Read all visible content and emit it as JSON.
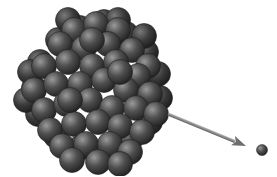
{
  "diagram": {
    "background": "#ffffff",
    "nucleus": {
      "sphere_radius": 12.5,
      "base_color": "#3c3c3c",
      "highlight_color": "#8a8a8a",
      "edge_color": "#1e1e1e",
      "back_spheres": [
        [
          80,
          28
        ],
        [
          104,
          22
        ],
        [
          58,
          40
        ],
        [
          126,
          34
        ],
        [
          146,
          52
        ],
        [
          40,
          62
        ],
        [
          34,
          88
        ],
        [
          38,
          114
        ],
        [
          56,
          136
        ],
        [
          80,
          148
        ],
        [
          106,
          150
        ],
        [
          130,
          140
        ],
        [
          150,
          122
        ],
        [
          160,
          98
        ],
        [
          158,
          74
        ],
        [
          68,
          20
        ],
        [
          118,
          20
        ],
        [
          144,
          36
        ],
        [
          26,
          100
        ],
        [
          30,
          72
        ]
      ],
      "front_spheres": [
        [
          74,
          30
        ],
        [
          96,
          24
        ],
        [
          118,
          30
        ],
        [
          60,
          44
        ],
        [
          84,
          48
        ],
        [
          108,
          44
        ],
        [
          132,
          50
        ],
        [
          148,
          66
        ],
        [
          44,
          66
        ],
        [
          68,
          62
        ],
        [
          92,
          66
        ],
        [
          116,
          62
        ],
        [
          138,
          76
        ],
        [
          34,
          90
        ],
        [
          56,
          84
        ],
        [
          80,
          84
        ],
        [
          104,
          80
        ],
        [
          126,
          90
        ],
        [
          150,
          94
        ],
        [
          44,
          110
        ],
        [
          66,
          104
        ],
        [
          90,
          100
        ],
        [
          112,
          108
        ],
        [
          136,
          108
        ],
        [
          156,
          114
        ],
        [
          50,
          130
        ],
        [
          74,
          124
        ],
        [
          98,
          122
        ],
        [
          120,
          126
        ],
        [
          142,
          132
        ],
        [
          62,
          146
        ],
        [
          86,
          144
        ],
        [
          110,
          144
        ],
        [
          130,
          152
        ],
        [
          72,
          160
        ],
        [
          98,
          162
        ],
        [
          120,
          164
        ],
        [
          92,
          40
        ],
        [
          70,
          100
        ],
        [
          120,
          72
        ]
      ]
    },
    "arrow": {
      "x1": 168,
      "y1": 114,
      "x2": 246,
      "y2": 146,
      "color": "#8c8c8c",
      "head_color": "#6e6e6e"
    },
    "emitted_particle": {
      "cx": 262,
      "cy": 150,
      "r": 5.5,
      "base_color": "#3c3c3c",
      "highlight_color": "#9a9a9a"
    }
  }
}
